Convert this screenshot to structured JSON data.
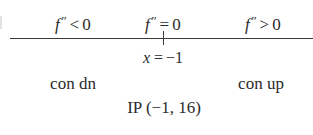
{
  "figure": {
    "kind": "sign-chart",
    "colors": {
      "background": "#ffffff",
      "ink": "#2b2b2b",
      "axis": "#3a3a3a"
    }
  },
  "top_labels": {
    "negative": {
      "function": "f",
      "prime": "″",
      "relation": "<",
      "value": "0",
      "full": "f″ < 0"
    },
    "zero": {
      "function": "f",
      "prime": "″",
      "relation": "=",
      "value": "0",
      "full": "f″ = 0"
    },
    "positive": {
      "function": "f",
      "prime": "″",
      "relation": ">",
      "value": "0",
      "full": "f″ > 0"
    }
  },
  "axis": {
    "tick_label": {
      "variable": "x",
      "relation": "=",
      "value": "−1",
      "full": "x = −1"
    }
  },
  "bottom_labels": {
    "left": "con dn",
    "right": "con up"
  },
  "inflection": {
    "label": "IP (−1, 16)",
    "abbreviation": "IP",
    "x": "−1",
    "y": "16"
  },
  "chart_data": {
    "type": "line",
    "title": "",
    "xlabel": "x",
    "ylabel": "",
    "grid": false,
    "legend": null,
    "annotations": [
      "f″ < 0",
      "f″ = 0",
      "f″ > 0",
      "x = −1",
      "con dn",
      "con up",
      "IP (−1, 16)"
    ],
    "critical_points": [
      {
        "x": -1,
        "y": 16,
        "type": "inflection point",
        "label": "IP (−1, 16)"
      }
    ],
    "intervals": [
      {
        "range": "x < −1",
        "second_derivative_sign": "negative",
        "concavity": "con dn"
      },
      {
        "range": "x = −1",
        "second_derivative_sign": "zero",
        "concavity": "inflection"
      },
      {
        "range": "x > −1",
        "second_derivative_sign": "positive",
        "concavity": "con up"
      }
    ],
    "ticks": [
      {
        "x": -1,
        "label": "x = −1"
      }
    ]
  }
}
